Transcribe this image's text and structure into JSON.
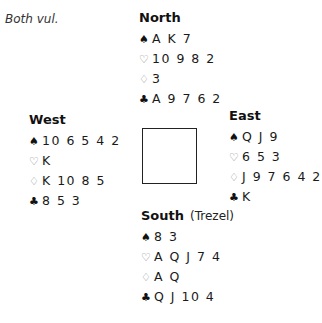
{
  "vulnerability": "Both vul.",
  "hands": {
    "north": {
      "label": "North",
      "player": "",
      "spades": "A K 7",
      "hearts": "10 9 8 2",
      "diamonds": "3",
      "clubs": "A 9 7 6 2"
    },
    "west": {
      "label": "West",
      "player": "",
      "spades": "10 6 5 4 2",
      "hearts": "K",
      "diamonds": "K 10 8 5",
      "clubs": "8 5 3"
    },
    "east": {
      "label": "East",
      "player": "",
      "spades": "Q J 9",
      "hearts": "6 5 3",
      "diamonds": "J 9 7 6 4 2",
      "clubs": "K"
    },
    "south": {
      "label": "South",
      "player": "(Trezel)",
      "spades": "8 3",
      "hearts": "A Q J 7 4",
      "diamonds": "A Q",
      "clubs": "Q J 10 4"
    }
  },
  "suit_icons": {
    "spades": "♠",
    "hearts": "♡",
    "diamonds": "♢",
    "clubs": "♣"
  }
}
